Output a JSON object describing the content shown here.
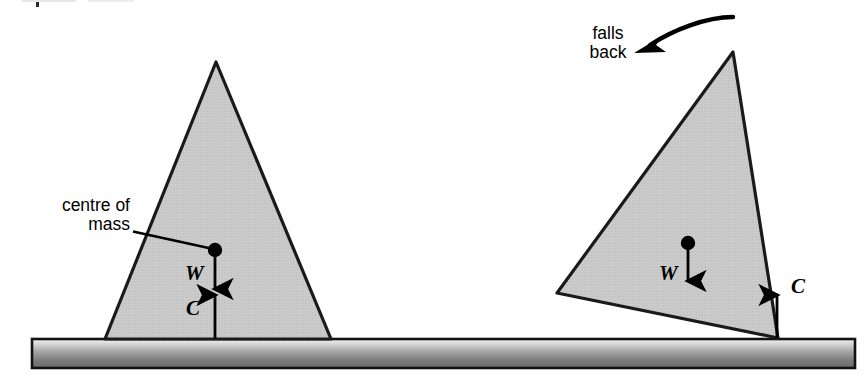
{
  "figure": {
    "background_color": "#ffffff"
  },
  "colors": {
    "block_fill": "#c9c9c9",
    "block_stroke": "#1a1a1a",
    "ground_top": "#f0f0f0",
    "ground_mid": "#9a9a9a",
    "ground_bottom": "#6e6e6e",
    "ground_border": "#1a1a1a",
    "ink": "#000000"
  },
  "annotations": {
    "centre_of_mass": {
      "line1": "centre of",
      "line2": "mass",
      "icon": "leader-line"
    },
    "falls_back": {
      "line1": "falls",
      "line2": "back",
      "icon": "curved-arrow-left"
    }
  },
  "force_labels": {
    "weight_left": "W",
    "contact_left": "C",
    "weight_right": "W",
    "contact_right": "C"
  },
  "geometry": {
    "ground": {
      "x": 32,
      "y": 339,
      "width": 823,
      "height": 29
    },
    "left_block": {
      "name": "upright-triangle",
      "points": "216,62 331,339 105,339",
      "centre_of_mass": {
        "cx": 215,
        "cy": 250,
        "r": 7
      },
      "weight_arrow": {
        "x1": 215,
        "y1": 256,
        "x2": 215,
        "y2": 296
      },
      "contact_arrow": {
        "x1": 215,
        "y1": 338,
        "x2": 215,
        "y2": 288
      }
    },
    "right_block": {
      "name": "tilted-triangle",
      "points": "733,52 777,338 557,293",
      "centre_of_mass": {
        "cx": 688,
        "cy": 243,
        "r": 7
      },
      "weight_arrow": {
        "x1": 688,
        "y1": 249,
        "x2": 688,
        "y2": 288
      },
      "contact_arrow": {
        "x1": 777,
        "y1": 338,
        "x2": 777,
        "y2": 288
      }
    },
    "leader_line": {
      "x1": 133,
      "y1": 231,
      "x2": 210,
      "y2": 248
    },
    "curved_arrow": {
      "from": [
        733,
        18
      ],
      "to": [
        641,
        51
      ]
    }
  }
}
